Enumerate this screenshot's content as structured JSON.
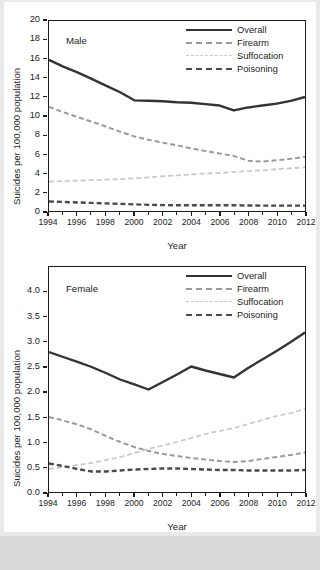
{
  "figure": {
    "background": "#e9e9e9",
    "sheet_background": "#ffffff"
  },
  "colors": {
    "overall": "#333333",
    "firearm": "#9a9a9a",
    "suffocation": "#c9c9c9",
    "poisoning": "#4a4a4a",
    "axis": "#1d1d1d"
  },
  "legend": {
    "position": "top-right",
    "items": [
      {
        "label": "Overall",
        "key": "overall"
      },
      {
        "label": "Firearm",
        "key": "firearm"
      },
      {
        "label": "Suffocation",
        "key": "suffocation"
      },
      {
        "label": "Poisoning",
        "key": "poisoning"
      }
    ]
  },
  "chart_data": [
    {
      "type": "line",
      "title": "Male",
      "panel_tag": "Male",
      "xlabel": "Year",
      "ylabel": "Suicides per 100,000 population",
      "xlim": [
        1994,
        2012
      ],
      "ylim": [
        0,
        20
      ],
      "grid": false,
      "xticks": [
        1994,
        1996,
        1998,
        2000,
        2002,
        2004,
        2006,
        2008,
        2010,
        2012
      ],
      "xticklabels": [
        "1994",
        "1996",
        "1998",
        "2000",
        "2002",
        "2004",
        "2006",
        "2008",
        "2010",
        "2012"
      ],
      "yticks": [
        0,
        2,
        4,
        6,
        8,
        10,
        12,
        14,
        16,
        18,
        20
      ],
      "yticklabels": [
        "0",
        "2",
        "4",
        "6",
        "8",
        "10",
        "12",
        "14",
        "16",
        "18",
        "20"
      ],
      "x": [
        1994,
        1995,
        1996,
        1997,
        1998,
        1999,
        2000,
        2001,
        2002,
        2003,
        2004,
        2005,
        2006,
        2007,
        2008,
        2009,
        2010,
        2011,
        2012
      ],
      "series": [
        {
          "name": "Overall",
          "values": [
            15.9,
            15.2,
            14.6,
            13.9,
            13.2,
            12.5,
            11.65,
            11.6,
            11.55,
            11.45,
            11.4,
            11.25,
            11.1,
            10.6,
            10.9,
            11.1,
            11.3,
            11.6,
            12.0
          ]
        },
        {
          "name": "Firearm",
          "values": [
            10.95,
            10.4,
            9.9,
            9.4,
            8.9,
            8.35,
            7.85,
            7.5,
            7.2,
            6.9,
            6.6,
            6.3,
            6.05,
            5.8,
            5.3,
            5.2,
            5.35,
            5.5,
            5.7,
            5.9
          ]
        },
        {
          "name": "Suffocation",
          "values": [
            3.1,
            3.15,
            3.2,
            3.25,
            3.3,
            3.35,
            3.45,
            3.55,
            3.65,
            3.75,
            3.85,
            3.95,
            4.0,
            4.1,
            4.2,
            4.3,
            4.4,
            4.5,
            4.6
          ]
        },
        {
          "name": "Poisoning",
          "values": [
            1.0,
            0.95,
            0.9,
            0.85,
            0.8,
            0.75,
            0.7,
            0.65,
            0.62,
            0.6,
            0.6,
            0.6,
            0.6,
            0.6,
            0.58,
            0.57,
            0.57,
            0.56,
            0.56
          ]
        }
      ]
    },
    {
      "type": "line",
      "title": "Female",
      "panel_tag": "Female",
      "xlabel": "Year",
      "ylabel": "Suicides per 100,000 population",
      "xlim": [
        1994,
        2012
      ],
      "ylim": [
        0.0,
        4.5
      ],
      "grid": false,
      "xticks": [
        1994,
        1996,
        1998,
        2000,
        2002,
        2004,
        2006,
        2008,
        2010,
        2012
      ],
      "xticklabels": [
        "1994",
        "1996",
        "1998",
        "2000",
        "2002",
        "2004",
        "2006",
        "2008",
        "2010",
        "2012"
      ],
      "yticks": [
        0.0,
        0.5,
        1.0,
        1.5,
        2.0,
        2.5,
        3.0,
        3.5,
        4.0
      ],
      "yticklabels": [
        "0.0",
        "0.5",
        "1.0",
        "1.5",
        "2.0",
        "2.5",
        "3.0",
        "3.5",
        "4.0"
      ],
      "x": [
        1994,
        1995,
        1996,
        1997,
        1998,
        1999,
        2000,
        2001,
        2002,
        2003,
        2004,
        2005,
        2006,
        2007,
        2008,
        2009,
        2010,
        2011,
        2012
      ],
      "series": [
        {
          "name": "Overall",
          "values": [
            2.8,
            2.7,
            2.6,
            2.5,
            2.38,
            2.25,
            2.15,
            2.05,
            2.2,
            2.35,
            2.51,
            2.43,
            2.36,
            2.29,
            2.48,
            2.65,
            2.82,
            3.0,
            3.19
          ]
        },
        {
          "name": "Firearm",
          "values": [
            1.5,
            1.43,
            1.35,
            1.25,
            1.12,
            1.0,
            0.9,
            0.82,
            0.76,
            0.72,
            0.68,
            0.65,
            0.62,
            0.6,
            0.62,
            0.66,
            0.7,
            0.74,
            0.79
          ]
        },
        {
          "name": "Suffocation",
          "values": [
            0.46,
            0.5,
            0.54,
            0.58,
            0.64,
            0.7,
            0.78,
            0.86,
            0.93,
            1.0,
            1.08,
            1.16,
            1.22,
            1.28,
            1.36,
            1.44,
            1.52,
            1.58,
            1.66
          ]
        },
        {
          "name": "Poisoning",
          "values": [
            0.57,
            0.52,
            0.46,
            0.41,
            0.41,
            0.43,
            0.45,
            0.46,
            0.47,
            0.47,
            0.46,
            0.45,
            0.44,
            0.44,
            0.43,
            0.43,
            0.43,
            0.43,
            0.44
          ]
        }
      ]
    }
  ]
}
